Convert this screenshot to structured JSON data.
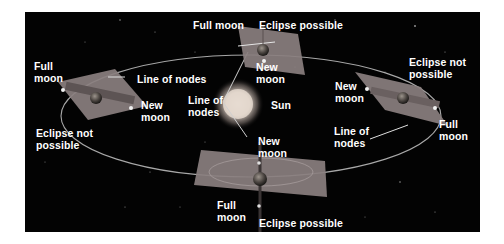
{
  "figure": {
    "colors": {
      "background": "#030303",
      "page": "#ffffff",
      "orbit": "#a8a8a8",
      "plane": "#8a7f7f",
      "label": "#ffffff",
      "sun": "#e8dcd0"
    },
    "labels": {
      "top_full_moon": "Full moon",
      "top_eclipse": "Eclipse possible",
      "top_new_moon": "New\nmoon",
      "left_full_moon": "Full\nmoon",
      "left_line_of_nodes": "Line of nodes",
      "left_new_moon": "New\nmoon",
      "left_eclipse": "Eclipse not\npossible",
      "center_line_of_nodes": "Line of\nnodes",
      "sun": "Sun",
      "bottom_new_moon": "New\nmoon",
      "bottom_full_moon": "Full\nmoon",
      "bottom_eclipse": "Eclipse possible",
      "right_eclipse": "Eclipse not\npossible",
      "right_new_moon": "New\nmoon",
      "right_line_of_nodes": "Line of\nnodes",
      "right_full_moon": "Full\nmoon"
    },
    "positions": [
      {
        "name": "top",
        "eclipse": "Eclipse possible"
      },
      {
        "name": "left",
        "eclipse": "Eclipse not possible"
      },
      {
        "name": "bottom",
        "eclipse": "Eclipse possible"
      },
      {
        "name": "right",
        "eclipse": "Eclipse not possible"
      }
    ],
    "icons": {
      "sun": "sun-icon",
      "earth": "earth-icon",
      "moon": "moon-icon",
      "orbital_plane": "orbital-plane-icon"
    }
  }
}
